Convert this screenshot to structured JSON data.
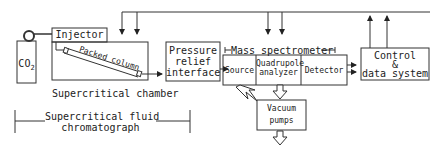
{
  "diagram": {
    "type": "block-diagram",
    "nodes": {
      "co2": {
        "label": "CO",
        "subscript": "2"
      },
      "injector": {
        "label": "Injector"
      },
      "packed_column": {
        "label": "Packed column"
      },
      "supercritical_chamber": {
        "label": "Supercritical chamber"
      },
      "pressure_relief": {
        "line1": "Pressure",
        "line2": "relief",
        "line3": "interface"
      },
      "mass_spectrometer": {
        "label": "Mass spectrometer"
      },
      "source": {
        "label": "Source"
      },
      "quadrupole": {
        "line1": "Quadrupole",
        "line2": "analyzer"
      },
      "detector": {
        "label": "Detector"
      },
      "control": {
        "line1": "Control",
        "line2": "&",
        "line3": "data system"
      },
      "vacuum_pumps": {
        "line1": "Vacuum",
        "line2": "pumps"
      }
    },
    "group_labels": {
      "sfc": {
        "line1": "Supercritical fluid",
        "line2": "chromatograph"
      }
    },
    "edges": [
      {
        "from": "co2",
        "to": "injector"
      },
      {
        "from": "supercritical_chamber",
        "to": "pressure_relief"
      },
      {
        "from": "pressure_relief",
        "to": "source"
      },
      {
        "from": "detector",
        "to": "control",
        "count": 2
      },
      {
        "from": "control",
        "to": "supercritical_chamber",
        "count": 2,
        "style": "feedback"
      },
      {
        "from": "control",
        "to": "quadrupole",
        "count": 2,
        "style": "feedback"
      },
      {
        "from": "source",
        "to": "vacuum_pumps",
        "style": "hollow-arrow"
      },
      {
        "from": "quadrupole",
        "to": "vacuum_pumps",
        "style": "hollow-arrow"
      },
      {
        "from": "vacuum_pumps",
        "to": "exhaust",
        "style": "hollow-arrow"
      }
    ]
  }
}
